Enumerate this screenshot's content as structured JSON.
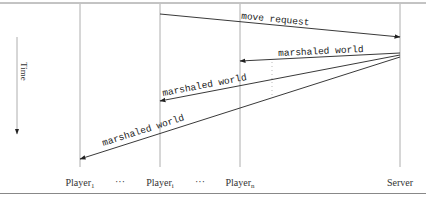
{
  "diagram": {
    "type": "sequence",
    "time_axis": {
      "label": "Time"
    },
    "participants": [
      {
        "id": "player1",
        "label": "Player",
        "sub": "1",
        "x": 80
      },
      {
        "id": "ellipsis1",
        "label": "···",
        "x": 120
      },
      {
        "id": "playeri",
        "label": "Player",
        "sub": "i",
        "x": 160
      },
      {
        "id": "ellipsis2",
        "label": "···",
        "x": 200
      },
      {
        "id": "playern",
        "label": "Player",
        "sub": "n",
        "x": 240
      },
      {
        "id": "server",
        "label": "Server",
        "x": 400
      }
    ],
    "messages": [
      {
        "id": "move-request",
        "from": "playeri",
        "to": "server",
        "label": "move request"
      },
      {
        "id": "marshaled-world-n",
        "from": "server",
        "to": "playern",
        "label": "marshaled world"
      },
      {
        "id": "marshaled-world-i",
        "from": "server",
        "to": "playeri",
        "label": "marshaled world"
      },
      {
        "id": "marshaled-world-1",
        "from": "server",
        "to": "player1",
        "label": "marshaled world"
      }
    ],
    "colors": {
      "line": "#999999",
      "arrow": "#222222",
      "rule": "#888888"
    }
  }
}
